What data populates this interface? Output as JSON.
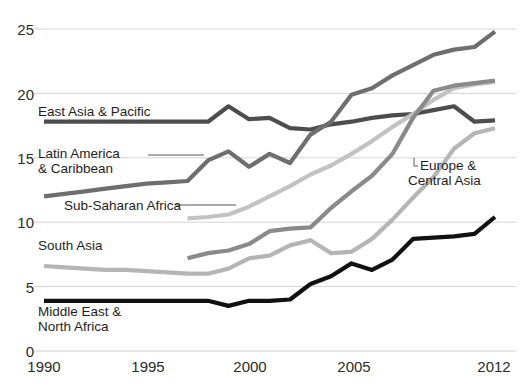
{
  "chart_data": {
    "type": "line",
    "title": "",
    "subtitle": "",
    "xlabel": "",
    "ylabel": "",
    "xlim": [
      1990,
      2012
    ],
    "ylim": [
      0,
      25
    ],
    "grid": true,
    "grid_axis": "y",
    "legend_position": "inline-labels",
    "y_ticks": [
      0,
      5,
      10,
      15,
      20,
      25
    ],
    "y_tick_labels": [
      "0",
      "5",
      "10",
      "15",
      "20",
      "25"
    ],
    "x_ticks": [
      1990,
      1995,
      2000,
      2005,
      2012
    ],
    "x_tick_labels": [
      "1990",
      "1995",
      "2000",
      "2005",
      "2012"
    ],
    "x": [
      1990,
      1991,
      1992,
      1993,
      1994,
      1995,
      1996,
      1997,
      1998,
      1999,
      2000,
      2001,
      2002,
      2003,
      2004,
      2005,
      2006,
      2007,
      2008,
      2009,
      2010,
      2011,
      2012
    ],
    "series": [
      {
        "name": "East Asia & Pacific",
        "color": "#4d4d4d",
        "x": [
          1990,
          1991,
          1992,
          1993,
          1994,
          1995,
          1996,
          1997,
          1998,
          1999,
          2000,
          2001,
          2002,
          2003,
          2004,
          2005,
          2006,
          2007,
          2008,
          2009,
          2010,
          2011,
          2012
        ],
        "values": [
          17.8,
          17.8,
          17.8,
          17.8,
          17.8,
          17.8,
          17.8,
          17.8,
          17.8,
          19.0,
          18.0,
          18.1,
          17.3,
          17.2,
          17.6,
          17.8,
          18.1,
          18.3,
          18.4,
          18.7,
          19.0,
          17.8,
          17.9
        ]
      },
      {
        "name": "Latin America & Caribbean",
        "color": "#6e6e6e",
        "x": [
          1990,
          1991,
          1992,
          1993,
          1994,
          1995,
          1996,
          1997,
          1998,
          1999,
          2000,
          2001,
          2002,
          2003,
          2004,
          2005,
          2006,
          2007,
          2008,
          2009,
          2010,
          2011,
          2012
        ],
        "values": [
          12.0,
          12.2,
          12.4,
          12.6,
          12.8,
          13.0,
          13.1,
          13.2,
          14.8,
          15.5,
          14.3,
          15.3,
          14.6,
          16.8,
          17.8,
          19.9,
          20.4,
          21.4,
          22.2,
          23.0,
          23.4,
          23.6,
          24.8
        ]
      },
      {
        "name": "Sub-Saharan Africa",
        "color": "#c2c2c2",
        "x": [
          1997,
          1998,
          1999,
          2000,
          2001,
          2002,
          2003,
          2004,
          2005,
          2006,
          2007,
          2008,
          2009,
          2010,
          2011,
          2012
        ],
        "values": [
          10.3,
          10.4,
          10.6,
          11.2,
          12.0,
          12.8,
          13.7,
          14.4,
          15.3,
          16.3,
          17.4,
          18.4,
          19.5,
          20.4,
          20.7,
          20.9
        ]
      },
      {
        "name": "South Asia",
        "color": "#b5b5b5",
        "x": [
          1990,
          1991,
          1992,
          1993,
          1994,
          1995,
          1996,
          1997,
          1998,
          1999,
          2000,
          2001,
          2002,
          2003,
          2004,
          2005,
          2006,
          2007,
          2008,
          2009,
          2010,
          2011,
          2012
        ],
        "values": [
          6.6,
          6.5,
          6.4,
          6.3,
          6.3,
          6.2,
          6.1,
          6.0,
          6.0,
          6.4,
          7.2,
          7.4,
          8.2,
          8.6,
          7.6,
          7.7,
          8.7,
          10.2,
          11.9,
          13.5,
          15.7,
          16.9,
          17.3
        ]
      },
      {
        "name": "Europe & Central Asia",
        "color": "#8a8a8a",
        "x": [
          1997,
          1998,
          1999,
          2000,
          2001,
          2002,
          2003,
          2004,
          2005,
          2006,
          2007,
          2008,
          2009,
          2010,
          2011,
          2012
        ],
        "values": [
          7.2,
          7.6,
          7.8,
          8.3,
          9.3,
          9.5,
          9.6,
          11.1,
          12.4,
          13.6,
          15.3,
          18.1,
          20.2,
          20.6,
          20.8,
          21.0
        ]
      },
      {
        "name": "Middle East & North Africa",
        "color": "#111111",
        "x": [
          1990,
          1991,
          1992,
          1993,
          1994,
          1995,
          1996,
          1997,
          1998,
          1999,
          2000,
          2001,
          2002,
          2003,
          2004,
          2005,
          2006,
          2007,
          2008,
          2009,
          2010,
          2011,
          2012
        ],
        "values": [
          3.9,
          3.9,
          3.9,
          3.9,
          3.9,
          3.9,
          3.9,
          3.9,
          3.9,
          3.5,
          3.9,
          3.9,
          4.0,
          5.2,
          5.8,
          6.8,
          6.3,
          7.1,
          8.7,
          8.8,
          8.9,
          9.1,
          10.4
        ]
      }
    ],
    "annotations": [
      {
        "label": "East Asia & Pacific",
        "x_px": 38,
        "y_px": 106,
        "leader": false
      },
      {
        "label": "Latin America\n& Caribbean",
        "x_px": 38,
        "y_px": 148,
        "leader": true
      },
      {
        "label": "Sub-Saharan Africa",
        "x_px": 64,
        "y_px": 200,
        "leader": true
      },
      {
        "label": "South Asia",
        "x_px": 38,
        "y_px": 240,
        "leader": false
      },
      {
        "label": "Middle East &\nNorth Africa",
        "x_px": 38,
        "y_px": 305,
        "leader": false
      },
      {
        "label": "Europe &\nCentral Asia",
        "x_px": 412,
        "y_px": 160,
        "leader": true
      }
    ]
  },
  "labels": {
    "east_asia": "East Asia & Pacific",
    "latin_america_1": "Latin America",
    "latin_america_2": "& Caribbean",
    "sub_saharan": "Sub-Saharan Africa",
    "south_asia": "South Asia",
    "mena_1": "Middle East &",
    "mena_2": "North Africa",
    "europe_1": "Europe &",
    "europe_2": "Central Asia"
  },
  "axis": {
    "y": {
      "t0": "0",
      "t5": "5",
      "t10": "10",
      "t15": "15",
      "t20": "20",
      "t25": "25"
    },
    "x": {
      "t1990": "1990",
      "t1995": "1995",
      "t2000": "2000",
      "t2005": "2005",
      "t2012": "2012"
    }
  },
  "colors": {
    "background": "#ffffff",
    "grid": "#cfcfcf",
    "text": "#222222",
    "east_asia": "#4d4d4d",
    "latin_america": "#6e6e6e",
    "sub_saharan": "#c2c2c2",
    "south_asia": "#b5b5b5",
    "europe_central_asia": "#8a8a8a",
    "middle_east_north_africa": "#111111"
  }
}
